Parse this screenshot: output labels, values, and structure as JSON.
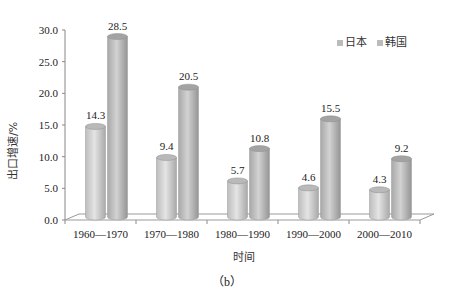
{
  "chart_data": {
    "type": "bar",
    "style": "3d-cylinder",
    "title": "",
    "caption": "(b)",
    "xlabel": "时间",
    "ylabel": "出口增速/%",
    "ylim": [
      0,
      30
    ],
    "yticks": [
      "0.0",
      "5.0",
      "10.0",
      "15.0",
      "20.0",
      "25.0",
      "30.0"
    ],
    "categories": [
      "1960—1970",
      "1970—1980",
      "1980—1990",
      "1990—2000",
      "2000—2010"
    ],
    "series": [
      {
        "name": "日本",
        "values": [
          14.3,
          9.4,
          5.7,
          4.6,
          4.3
        ],
        "color": "#c8c8c8"
      },
      {
        "name": "韩国",
        "values": [
          28.5,
          20.5,
          10.8,
          15.5,
          9.2
        ],
        "color": "#b0b0b0"
      }
    ],
    "legend_position": "top-right",
    "grid": false
  },
  "labels": {
    "caption": "(b)",
    "xlabel": "时间",
    "ylabel": "出口增速/%",
    "legend": [
      "日本",
      "韩国"
    ]
  }
}
